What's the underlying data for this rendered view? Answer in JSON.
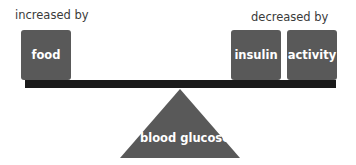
{
  "diagram": {
    "left_label": "increased by",
    "right_label": "decreased by",
    "left_items": [
      {
        "label": "food"
      }
    ],
    "right_items": [
      {
        "label": "insulin"
      },
      {
        "label": "activity"
      }
    ],
    "fulcrum_label": "blood glucose",
    "colors": {
      "box": "#595959",
      "bar": "#1a1a1a",
      "text": "#3a3a3a",
      "box_text": "#ffffff"
    }
  }
}
